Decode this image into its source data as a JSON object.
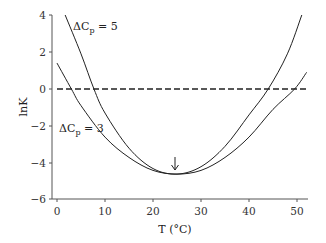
{
  "chart_data": {
    "type": "line",
    "title": "",
    "xlabel": "T (°C)",
    "ylabel": "lnK",
    "xlim": [
      0,
      52
    ],
    "ylim": [
      -6,
      4
    ],
    "xticks": [
      0,
      10,
      20,
      30,
      40,
      50
    ],
    "yticks": [
      4,
      2,
      0,
      -2,
      -4,
      -6
    ],
    "grid": false,
    "legend": "inline labels",
    "series": [
      {
        "name": "ΔCp = 5",
        "x": [
          1.7,
          5,
          7.7,
          10,
          15,
          20,
          25,
          30,
          35,
          40,
          44,
          48,
          51
        ],
        "y": [
          4.0,
          1.9,
          0.0,
          -1.3,
          -3.2,
          -4.3,
          -4.6,
          -4.2,
          -3.1,
          -1.4,
          0.0,
          1.9,
          4.0
        ]
      },
      {
        "name": "ΔCp = 3",
        "x": [
          0,
          3,
          5,
          10,
          15,
          20,
          25,
          30,
          35,
          40,
          45,
          49.5,
          52
        ],
        "y": [
          1.4,
          0.0,
          -0.9,
          -2.6,
          -3.7,
          -4.4,
          -4.6,
          -4.4,
          -3.7,
          -2.6,
          -1.1,
          0.0,
          0.9
        ]
      },
      {
        "name": "lnK = 0",
        "style": "dashed",
        "x": [
          0,
          52
        ],
        "y": [
          0,
          0
        ]
      }
    ],
    "annotations": [
      {
        "text": "ΔCp = 5",
        "x": 3.5,
        "y": 3.4
      },
      {
        "text": "ΔCp = 3",
        "x": 0.5,
        "y": -2.3
      },
      {
        "text": "arrow marking minimum",
        "x": 24.6,
        "y": -4.6
      }
    ]
  },
  "labels": {
    "xlabel": "T (°C)",
    "ylabel": "lnK",
    "cp5_delta": "ΔC",
    "cp5_sub": "p",
    "cp5_val": " = 5",
    "cp3_delta": "ΔC",
    "cp3_sub": "p",
    "cp3_val": " = 3"
  },
  "ticks": {
    "x": [
      "0",
      "10",
      "20",
      "30",
      "40",
      "50"
    ],
    "y": [
      "4",
      "2",
      "0",
      "−2",
      "−4",
      "−6"
    ]
  }
}
